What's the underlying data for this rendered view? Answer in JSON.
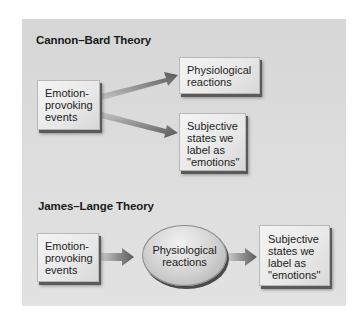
{
  "cannon_bard": {
    "title": "Cannon–Bard Theory",
    "source_box": {
      "lines": [
        "Emotion-",
        "provoking",
        "events"
      ]
    },
    "target_top": {
      "lines": [
        "Physiological",
        "reactions"
      ]
    },
    "target_bottom": {
      "lines": [
        "Subjective",
        "states we",
        "label as",
        "\"emotions\""
      ]
    }
  },
  "james_lange": {
    "title": "James–Lange Theory",
    "source_box": {
      "lines": [
        "Emotion-",
        "provoking",
        "events"
      ]
    },
    "middle_ellipse": {
      "lines": [
        "Physiological",
        "reactions"
      ]
    },
    "target_box": {
      "lines": [
        "Subjective",
        "states we",
        "label as",
        "\"emotions\""
      ]
    }
  },
  "colors": {
    "panel_background": "#dcdcdc",
    "box_fill": "#ececec",
    "arrow_dark": "#555555",
    "arrow_light": "#bdbdbd",
    "text": "#222222"
  }
}
